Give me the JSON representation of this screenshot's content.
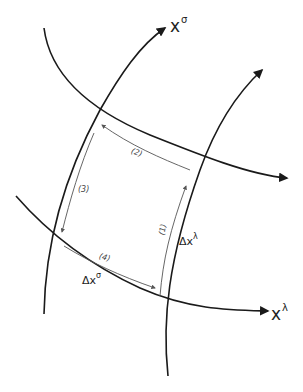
{
  "diagram": {
    "axes": [
      {
        "id": "x-sigma",
        "base": "x",
        "sup": "σ"
      },
      {
        "id": "x-lambda",
        "base": "x",
        "sup": "λ"
      }
    ],
    "increments": [
      {
        "id": "delta-x-lambda",
        "base": "Δx",
        "sup": "λ"
      },
      {
        "id": "delta-x-sigma",
        "base": "Δx",
        "sup": "σ"
      }
    ],
    "path_labels": [
      "(1)",
      "(2)",
      "(3)",
      "(4)"
    ],
    "colors": {
      "curve": "#1a1a1a",
      "path": "#555555",
      "background": "#ffffff"
    }
  }
}
